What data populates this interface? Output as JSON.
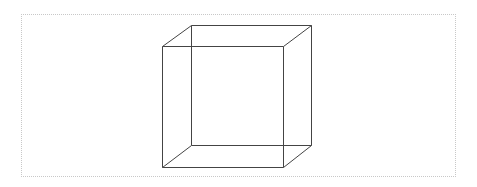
{
  "diagram": {
    "type": "wireframe-cube",
    "stroke_color": "#444444",
    "border_color": "#c8c8c8",
    "front_face": {
      "top_left": [
        162,
        46
      ],
      "top_right": [
        283,
        46
      ],
      "bottom_right": [
        283,
        167
      ],
      "bottom_left": [
        162,
        167
      ]
    },
    "back_face": {
      "top_left": [
        191,
        25
      ],
      "top_right": [
        311,
        25
      ],
      "bottom_right": [
        311,
        145
      ],
      "bottom_left": [
        191,
        145
      ]
    }
  }
}
